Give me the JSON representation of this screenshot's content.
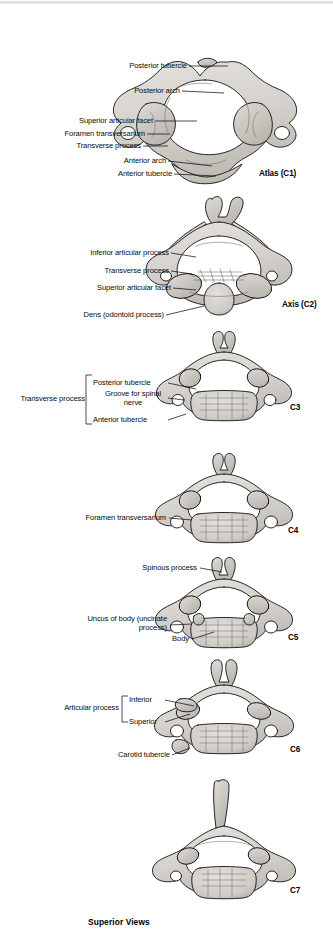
{
  "plate": {
    "title": "Cervical Vertebrae",
    "footer": "Superior Views",
    "view": "Superior Views"
  },
  "colors": {
    "bone_fill": "#d9d7d2",
    "bone_shade": "#b4b1ab",
    "bone_dark": "#8d8a84",
    "outline": "#111111",
    "page": "#ffffff",
    "top_strip": "#dcdcdd",
    "text": "#0b0b0b"
  },
  "figures": [
    {
      "id": "c1",
      "tag": "Atlas (C1)",
      "labels": [
        {
          "key": "posterior-tubercle",
          "text": "Posterior tubercle"
        },
        {
          "key": "posterior-arch",
          "text": "Posterior arch"
        },
        {
          "key": "superior-articular-facet",
          "text": "Superior articular facet"
        },
        {
          "key": "foramen-transversarium",
          "text": "Foramen transversarium"
        },
        {
          "key": "transverse-process",
          "text": "Transverse process"
        },
        {
          "key": "anterior-arch",
          "text": "Anterior arch"
        },
        {
          "key": "anterior-tubercle",
          "text": "Anterior tubercle"
        }
      ]
    },
    {
      "id": "c2",
      "tag": "Axis (C2)",
      "labels": [
        {
          "key": "inferior-articular-process",
          "text": "Inferior articular process"
        },
        {
          "key": "transverse-process",
          "text": "Transverse process"
        },
        {
          "key": "superior-articular-facet",
          "text": "Superior articular facet"
        },
        {
          "key": "dens",
          "text": "Dens (odontoid process)"
        }
      ]
    },
    {
      "id": "c3",
      "tag": "C3",
      "bracket_label": "Transverse process",
      "labels": [
        {
          "key": "posterior-tubercle",
          "text": "Posterior tubercle"
        },
        {
          "key": "groove-spinal-nerve",
          "text": "Groove for spinal nerve"
        },
        {
          "key": "anterior-tubercle",
          "text": "Anterior tubercle"
        }
      ]
    },
    {
      "id": "c4",
      "tag": "C4",
      "labels": [
        {
          "key": "foramen-transversarium",
          "text": "Foramen transversarium"
        }
      ]
    },
    {
      "id": "c5",
      "tag": "C5",
      "labels": [
        {
          "key": "spinous-process",
          "text": "Spinous process"
        },
        {
          "key": "uncus-of-body",
          "text": "Uncus of body (uncinate process)"
        },
        {
          "key": "body",
          "text": "Body"
        }
      ]
    },
    {
      "id": "c6",
      "tag": "C6",
      "bracket_label": "Articular process",
      "labels": [
        {
          "key": "inferior",
          "text": "Inferior"
        },
        {
          "key": "superior",
          "text": "Superior"
        },
        {
          "key": "carotid-tubercle",
          "text": "Carotid tubercle"
        }
      ]
    },
    {
      "id": "c7",
      "tag": "C7",
      "labels": []
    }
  ]
}
